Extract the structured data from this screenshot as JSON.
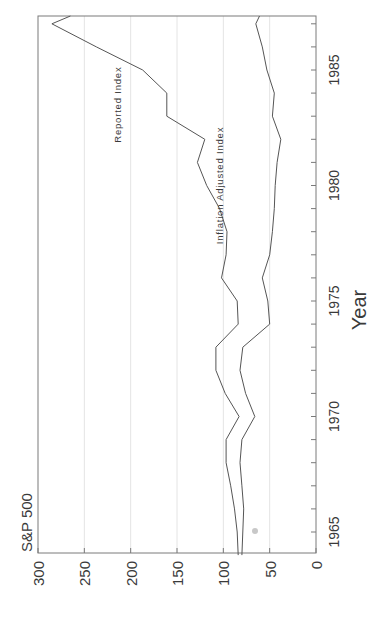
{
  "chart_data": {
    "type": "line",
    "orientation": "rotated-90-ccw",
    "title": "S&P 500",
    "xlabel": "Year",
    "ylabel": "",
    "xlim": [
      1964,
      1987.5
    ],
    "ylim": [
      0,
      300
    ],
    "xticks": [
      1965,
      1970,
      1975,
      1980,
      1985
    ],
    "yticks": [
      0,
      50,
      100,
      150,
      200,
      250,
      300
    ],
    "grid": {
      "y_major": true,
      "x_major": false
    },
    "legend": "inline-labels",
    "x": [
      1964,
      1965,
      1966,
      1967,
      1968,
      1969,
      1970,
      1971,
      1972,
      1973,
      1974,
      1975,
      1976,
      1977,
      1978,
      1979,
      1980,
      1981,
      1982,
      1983,
      1984,
      1985,
      1986,
      1987,
      1987.5
    ],
    "series": [
      {
        "name": "Reported Index",
        "label_pos": {
          "x": 1983.5,
          "y": 210
        },
        "values": [
          84,
          85,
          88,
          92,
          97,
          97,
          83,
          98,
          108,
          108,
          84,
          85,
          102,
          97,
          96,
          104,
          118,
          128,
          120,
          161,
          161,
          187,
          237,
          285,
          265
        ]
      },
      {
        "name": "Inflation Adjusted Index",
        "label_pos": {
          "x": 1980,
          "y": 100
        },
        "values": [
          80,
          79,
          78,
          80,
          82,
          80,
          66,
          76,
          82,
          79,
          50,
          52,
          58,
          50,
          47,
          45,
          44,
          42,
          38,
          47,
          45,
          53,
          58,
          65,
          61
        ]
      }
    ]
  },
  "labels": {
    "title": "S&P 500",
    "xlabel": "Year",
    "series_0": "Reported Index",
    "series_1": "Inflation Adjusted Index"
  }
}
